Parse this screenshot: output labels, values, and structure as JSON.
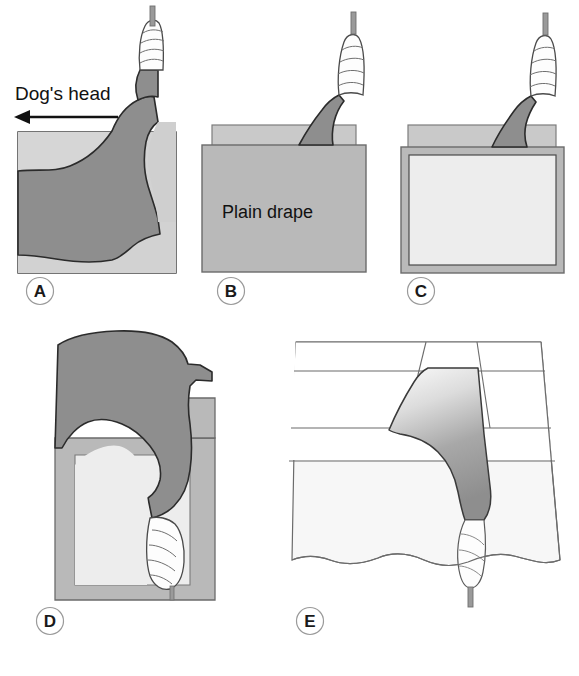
{
  "figure": {
    "background_color": "#ffffff",
    "width": 579,
    "height": 676
  },
  "colors": {
    "body_dark_gray": "#8e8e8e",
    "drape_mid_gray": "#b9b9b9",
    "drape_light_gray": "#c9c9c9",
    "fenestration_pale": "#ededed",
    "outline_dark": "#2b2b2b",
    "outline_mid": "#6b6b6b",
    "outline_light": "#8a8a8a",
    "bandage_white": "#fdfdfd",
    "rod_gray": "#9a9a9a",
    "table_white": "#ffffff",
    "cloth_pale": "#f2f2f2"
  },
  "annotations": {
    "direction_label": "Dog's head",
    "direction_arrow": "left-arrow"
  },
  "panels": [
    {
      "id": "A",
      "letter": "A",
      "label_position": {
        "x": 40,
        "y": 291
      },
      "description": "Limb suspended, patient body on table, head to the left",
      "elements": [
        "suspension-rod",
        "bandaged-distal-limb",
        "dog-body",
        "table-surface"
      ]
    },
    {
      "id": "B",
      "letter": "B",
      "label_position": {
        "x": 231,
        "y": 291
      },
      "description": "Plain drape placed over patient body",
      "drape_label": "Plain drape",
      "drape_label_position": {
        "x": 281,
        "y": 212
      },
      "elements": [
        "suspension-rod",
        "bandaged-distal-limb",
        "plain-drape",
        "under-drape-strip"
      ]
    },
    {
      "id": "C",
      "letter": "C",
      "label_position": {
        "x": 421,
        "y": 291
      },
      "description": "Fenestrated drape positioned over plain drape",
      "elements": [
        "suspension-rod",
        "bandaged-distal-limb",
        "fenestrated-drape",
        "fenestration-window"
      ]
    },
    {
      "id": "D",
      "letter": "D",
      "label_position": {
        "x": 50,
        "y": 621
      },
      "description": "Rotated view, limb brought through drape fenestration",
      "elements": [
        "dog-body-rotated",
        "bandaged-distal-limb",
        "fenestrated-drape",
        "fenestration-window"
      ]
    },
    {
      "id": "E",
      "letter": "E",
      "label_position": {
        "x": 310,
        "y": 621
      },
      "description": "Final draped field with limb exteriorised through fenestration",
      "elements": [
        "draped-table",
        "drape-fold-lines",
        "exposed-limb",
        "bandaged-distal-limb",
        "wavy-drape-edge"
      ]
    }
  ],
  "icons": {
    "panel_letter_circle": "circle-outline",
    "arrow": "arrow-left-icon"
  }
}
